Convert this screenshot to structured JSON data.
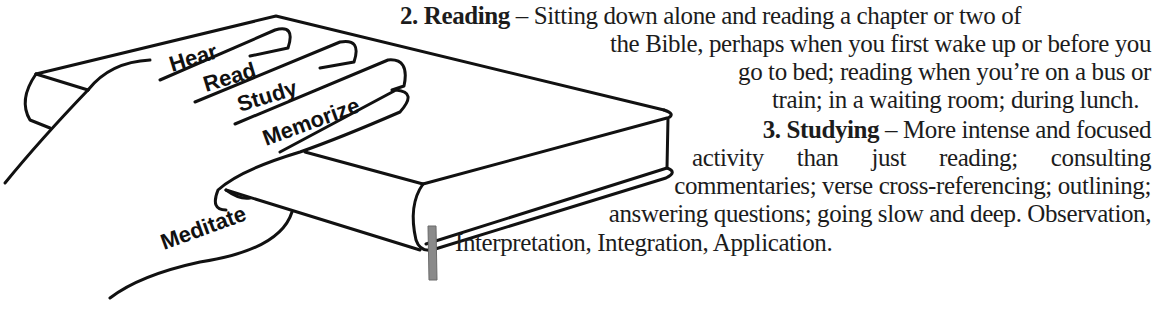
{
  "illustration": {
    "subject": "hand-on-bible",
    "finger_labels": [
      "Hear",
      "Read",
      "Study",
      "Memorize",
      "Meditate"
    ],
    "bookmark_color": "#8a8a8a",
    "line_color": "#111111"
  },
  "sections": [
    {
      "number": "2.",
      "title": "Reading",
      "dash": "–",
      "lines": [
        "Sitting down alone and reading a chapter or two of",
        "the Bible, perhaps when you first wake up or before you",
        "go to bed; reading when you’re on a bus or",
        "train; in a waiting room; during lunch."
      ]
    },
    {
      "number": "3.",
      "title": "Studying",
      "dash": "–",
      "lines": [
        "More intense and focused",
        "activity than just reading; consulting",
        "commentaries; verse cross-referencing; outlining;",
        "answering questions; going slow and deep.  Observation,",
        "Interpretation, Integration, Application."
      ]
    }
  ]
}
